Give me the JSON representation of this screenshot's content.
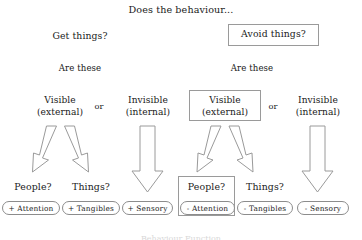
{
  "diagram": {
    "title": "Does the behaviour...",
    "branches": {
      "left": {
        "question": "Get things?",
        "are_these": "Are these",
        "visible": "Visible\n(external)",
        "visible_line1": "Visible",
        "visible_line2": "(external)",
        "or": "or",
        "invisible_line1": "Invisible",
        "invisible_line2": "(internal)",
        "people": "People?",
        "things": "Things?",
        "outcome_people": "+ Attention",
        "outcome_things": "+ Tangibles",
        "outcome_sensory": "+ Sensory"
      },
      "right": {
        "question": "Avoid things?",
        "are_these": "Are these",
        "visible_line1": "Visible",
        "visible_line2": "(external)",
        "or": "or",
        "invisible_line1": "Invisible",
        "invisible_line2": "(internal)",
        "people": "People?",
        "things": "Things?",
        "outcome_people": "- Attention",
        "outcome_things": "- Tangibles",
        "outcome_sensory": "- Sensory"
      }
    },
    "caption_cut": "Behaviour Function",
    "colors": {
      "background": "#ffffff",
      "text": "#1a1a1a",
      "stroke": "#9a9a9a",
      "pill_border": "#8c8c8c",
      "highlight_border": "#9a9a9a"
    }
  }
}
